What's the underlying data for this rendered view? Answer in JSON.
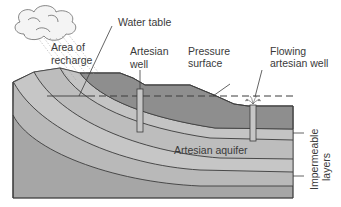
{
  "diagram": {
    "labels": {
      "water_table": "Water table",
      "area_of_recharge_line1": "Area of",
      "area_of_recharge_line2": "recharge",
      "artesian_well_line1": "Artesian",
      "artesian_well_line2": "well",
      "pressure_surface_line1": "Pressure",
      "pressure_surface_line2": "surface",
      "flowing_well_line1": "Flowing",
      "flowing_well_line2": "artesian well",
      "artesian_aquifer": "Artesian aquifer",
      "impermeable_line1": "Impermeable",
      "impermeable_line2": "layers"
    },
    "colors": {
      "surface_layer": "#8e8e8e",
      "impermeable_layer": "#b9b9b9",
      "aquifer_layer": "#c6c6c6",
      "deep_layer": "#a6a6a6",
      "outline": "#3c3c3c",
      "text": "#3a3a3a"
    },
    "icons": [
      "cloud-icon",
      "rain-icon",
      "water-spray-icon"
    ]
  }
}
